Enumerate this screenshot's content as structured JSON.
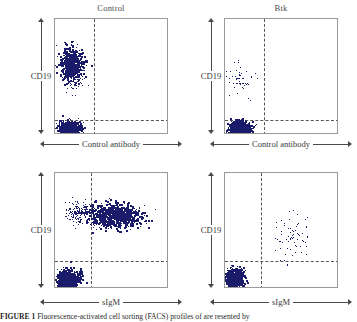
{
  "figure": {
    "type": "flow-cytometry-dotplot-grid",
    "columns": [
      {
        "id": "control",
        "title": "Control"
      },
      {
        "id": "btk",
        "title": "Btk"
      }
    ],
    "rows": [
      {
        "id": "control-antibody",
        "xlabel": "Control antibody"
      },
      {
        "id": "sigm",
        "xlabel": "sIgM"
      }
    ],
    "ylabel": "CD19",
    "point_color": "#1b1b6b",
    "frame_color": "#9a9a9a",
    "gate_color": "#555555"
  },
  "caption": {
    "bold_lead": "FIGURE 1",
    "text": "Fluorescence-activated cell sorting (FACS) profiles of are resented by"
  },
  "chart_data": [
    {
      "type": "scatter",
      "id": "panel-control-control-antibody",
      "title": "Control",
      "xlabel": "Control antibody",
      "ylabel": "CD19",
      "xlim": [
        0,
        100
      ],
      "ylim": [
        0,
        100
      ],
      "grid": false,
      "gates": {
        "x": 34,
        "y": 13
      },
      "quadrant_populations": [
        {
          "name": "CD19+ B cells",
          "quadrant": "upper-left",
          "x_center": 14,
          "y_center": 62,
          "x_spread": 9,
          "y_spread": 13,
          "n": 600,
          "density": "dense"
        },
        {
          "name": "CD19- cells",
          "quadrant": "lower-left",
          "x_center": 12,
          "y_center": 5,
          "x_spread": 9,
          "y_spread": 5,
          "n": 700,
          "density": "dense"
        },
        {
          "name": "transitional",
          "quadrant": "upper-left",
          "x_center": 18,
          "y_center": 45,
          "x_spread": 8,
          "y_spread": 10,
          "n": 40,
          "density": "sparse"
        }
      ]
    },
    {
      "type": "scatter",
      "id": "panel-btk-control-antibody",
      "title": "Btk",
      "xlabel": "Control antibody",
      "ylabel": "CD19",
      "xlim": [
        0,
        100
      ],
      "ylim": [
        0,
        100
      ],
      "grid": false,
      "gates": {
        "x": 34,
        "y": 13
      },
      "quadrant_populations": [
        {
          "name": "CD19+ B cells (reduced)",
          "quadrant": "upper-left",
          "x_center": 13,
          "y_center": 48,
          "x_spread": 10,
          "y_spread": 14,
          "n": 55,
          "density": "sparse"
        },
        {
          "name": "CD19- cells",
          "quadrant": "lower-left",
          "x_center": 12,
          "y_center": 5,
          "x_spread": 9,
          "y_spread": 5,
          "n": 700,
          "density": "dense"
        }
      ]
    },
    {
      "type": "scatter",
      "id": "panel-control-sigm",
      "title": "Control",
      "xlabel": "sIgM",
      "ylabel": "CD19",
      "xlim": [
        0,
        100
      ],
      "ylim": [
        0,
        100
      ],
      "grid": false,
      "gates": {
        "x": 31,
        "y": 24
      },
      "quadrant_populations": [
        {
          "name": "sIgM+ CD19+ mature B cells",
          "quadrant": "upper-right",
          "x_center": 52,
          "y_center": 63,
          "x_spread": 22,
          "y_spread": 9,
          "n": 850,
          "density": "dense"
        },
        {
          "name": "sIgM-lo CD19+ B cells",
          "quadrant": "upper-left",
          "x_center": 20,
          "y_center": 66,
          "x_spread": 9,
          "y_spread": 8,
          "n": 150,
          "density": "medium"
        },
        {
          "name": "CD19- cells",
          "quadrant": "lower-left",
          "x_center": 11,
          "y_center": 7,
          "x_spread": 9,
          "y_spread": 7,
          "n": 700,
          "density": "dense"
        }
      ]
    },
    {
      "type": "scatter",
      "id": "panel-btk-sigm",
      "title": "Btk",
      "xlabel": "sIgM",
      "ylabel": "CD19",
      "xlim": [
        0,
        100
      ],
      "ylim": [
        0,
        100
      ],
      "grid": false,
      "gates": {
        "x": 31,
        "y": 24
      },
      "quadrant_populations": [
        {
          "name": "sIgM+ CD19+ B cells (markedly reduced)",
          "quadrant": "upper-right",
          "x_center": 60,
          "y_center": 46,
          "x_spread": 15,
          "y_spread": 18,
          "n": 70,
          "density": "sparse"
        },
        {
          "name": "CD19- cells",
          "quadrant": "lower-left",
          "x_center": 8,
          "y_center": 8,
          "x_spread": 7,
          "y_spread": 8,
          "n": 650,
          "density": "dense"
        }
      ]
    }
  ]
}
